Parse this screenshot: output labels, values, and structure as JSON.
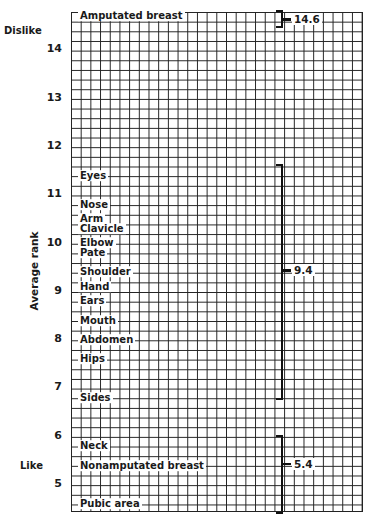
{
  "chart_data": {
    "type": "ranked-list",
    "title": "",
    "ylabel": "Average rank",
    "ylim": [
      4.4,
      14.9
    ],
    "yticks": [
      5,
      6,
      7,
      8,
      9,
      10,
      11,
      12,
      13,
      14
    ],
    "axis_ends": {
      "top": "Dislike",
      "bottom": "Like"
    },
    "grid": true,
    "items": [
      {
        "label": "Amputated breast",
        "rank": 14.6
      },
      {
        "label": "Eyes",
        "rank": 11.3
      },
      {
        "label": "Nose",
        "rank": 10.7
      },
      {
        "label": "Arm",
        "rank": 10.4
      },
      {
        "label": "Clavicle",
        "rank": 10.2
      },
      {
        "label": "Elbow",
        "rank": 9.9
      },
      {
        "label": "Pate",
        "rank": 9.7
      },
      {
        "label": "Shoulder",
        "rank": 9.3
      },
      {
        "label": "Hand",
        "rank": 9.0
      },
      {
        "label": "Ears",
        "rank": 8.7
      },
      {
        "label": "Mouth",
        "rank": 8.3
      },
      {
        "label": "Abdomen",
        "rank": 7.9
      },
      {
        "label": "Hips",
        "rank": 7.5
      },
      {
        "label": "Sides",
        "rank": 6.7
      },
      {
        "label": "Neck",
        "rank": 5.7
      },
      {
        "label": "Nonamputated breast",
        "rank": 5.3
      },
      {
        "label": "Pubic area",
        "rank": 4.5
      }
    ],
    "groups": [
      {
        "mean": 14.6,
        "label": "14.6",
        "top": 14.8,
        "bottom": 14.5
      },
      {
        "mean": 9.4,
        "label": "9.4",
        "top": 11.6,
        "bottom": 6.8
      },
      {
        "mean": 5.4,
        "label": "5.4",
        "top": 6.0,
        "bottom": 4.45
      }
    ]
  }
}
